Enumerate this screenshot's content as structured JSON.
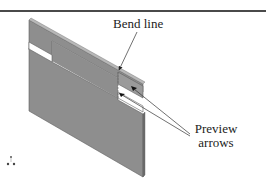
{
  "figure": {
    "labels": {
      "bend_line": "Bend line",
      "preview_line1": "Preview",
      "preview_line2": "arrows"
    },
    "colors": {
      "plate_face": "#8e8e8e",
      "plate_edge": "#5e5e5e",
      "plate_highlight": "#b8b8b8",
      "leader": "#333333",
      "rule": "#4a4a4a"
    },
    "icons": {
      "triad": "coordinate-triad-icon"
    }
  }
}
